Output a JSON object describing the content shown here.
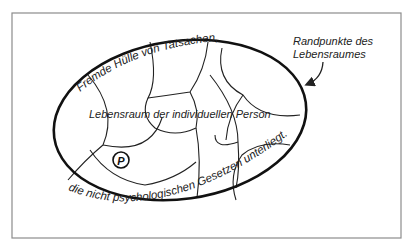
{
  "diagram": {
    "title_top_arc": "Fremde Hülle von Tatsachen,",
    "title_bottom_arc": "die nicht psychologischen Gesetzen unterliegt.",
    "center_label": "Lebensraum der individuellen Person",
    "person_marker": "P",
    "callout": {
      "line1": "Randpunkte des",
      "line2": "Lebensraumes"
    }
  },
  "colors": {
    "frame": "#8c8c8c",
    "ink": "#111111",
    "background": "#ffffff"
  }
}
